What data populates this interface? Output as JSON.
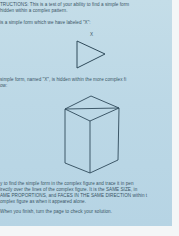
{
  "instructions": {
    "line1": "TRUCTIONS: This is a test of your ability to find a simple form",
    "line2": "hidden within a complex pattern.",
    "line3": "is a simple form which we have labeled \"X\":"
  },
  "simple_form": {
    "label": "X",
    "shape": "triangle"
  },
  "middle_text": {
    "line1": "simple form, named \"X\", is hidden within the more complex fi",
    "line2": "ow:"
  },
  "complex_form": {
    "shape": "box-prism"
  },
  "task_text": {
    "line1": "y to find the simple form in the complex figure and trace it in pen",
    "line2": "irectly over the lines of the complex figure. It is the SAME SIZE, in",
    "line3": "AME PROPORTIONS, and FACES IN THE SAME DIRECTION within t",
    "line4": "omplex figure as when it appeared alone."
  },
  "footer_text": {
    "line1": "When you finish, turn the page to check your solution."
  },
  "colors": {
    "paper": "#bcd8e6",
    "ink": "#2f4a5a",
    "border": "#f4f6f7"
  }
}
